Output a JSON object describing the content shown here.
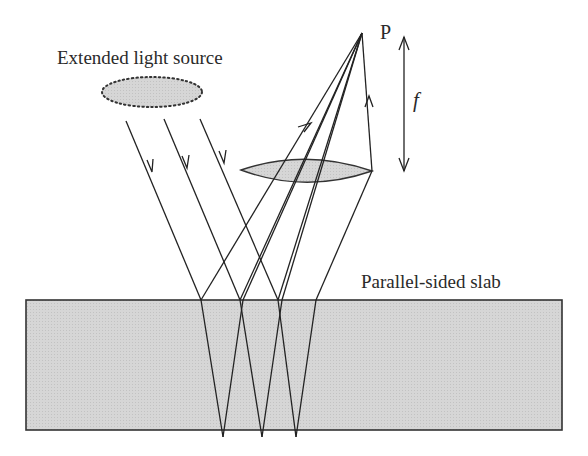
{
  "figure": {
    "labels": {
      "source": "Extended light source",
      "slab": "Parallel-sided slab",
      "point": "P",
      "focal_length": "f"
    },
    "colors": {
      "line": "#222222",
      "fill": "#d4d4d4",
      "background": "#ffffff"
    }
  }
}
